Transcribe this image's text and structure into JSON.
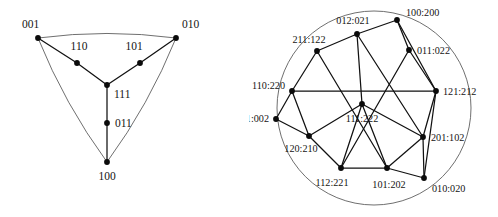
{
  "figure": {
    "title": "",
    "panels": [
      {
        "id": "left",
        "name": "binary-triangle-graph",
        "shape": "curved-triangle",
        "boundary_color": "#555555",
        "edge_color": "#111111",
        "vertex_color": "#0b0b0b",
        "nodes": [
          {
            "id": "n001",
            "label": "001",
            "x": 38,
            "y": 38,
            "lx": 22,
            "ly": 28,
            "anchor": "start"
          },
          {
            "id": "n010",
            "label": "010",
            "x": 176,
            "y": 38,
            "lx": 182,
            "ly": 28,
            "anchor": "start"
          },
          {
            "id": "n110",
            "label": "110",
            "x": 77,
            "y": 63,
            "lx": 79,
            "ly": 50,
            "anchor": "middle"
          },
          {
            "id": "n101",
            "label": "101",
            "x": 140,
            "y": 63,
            "lx": 134,
            "ly": 50,
            "anchor": "middle"
          },
          {
            "id": "n111",
            "label": "111",
            "x": 107,
            "y": 85,
            "lx": 114,
            "ly": 98,
            "anchor": "start"
          },
          {
            "id": "n011",
            "label": "011",
            "x": 107,
            "y": 123,
            "lx": 115,
            "ly": 127,
            "anchor": "start"
          },
          {
            "id": "n100",
            "label": "100",
            "x": 107,
            "y": 162,
            "lx": 107,
            "ly": 180,
            "anchor": "middle"
          }
        ],
        "edges": [
          [
            "n001",
            "n110"
          ],
          [
            "n110",
            "n111"
          ],
          [
            "n010",
            "n101"
          ],
          [
            "n101",
            "n111"
          ],
          [
            "n111",
            "n011"
          ],
          [
            "n011",
            "n100"
          ]
        ]
      },
      {
        "id": "right",
        "name": "ternary-wheel-graph",
        "shape": "circle",
        "boundary_color": "#555555",
        "edge_color": "#111111",
        "vertex_color": "#0b0b0b",
        "circle": {
          "cx": 125,
          "cy": 108,
          "r": 97
        },
        "nodes": [
          {
            "id": "r100",
            "label": "100:200",
            "x": 148,
            "y": 20,
            "lx": 157,
            "ly": 16,
            "anchor": "start"
          },
          {
            "id": "r012",
            "label": "012:021",
            "x": 108,
            "y": 34,
            "lx": 104,
            "ly": 24,
            "anchor": "middle"
          },
          {
            "id": "r211",
            "label": "211:122",
            "x": 68,
            "y": 51,
            "lx": 60,
            "ly": 43,
            "anchor": "middle"
          },
          {
            "id": "r011",
            "label": "011:022",
            "x": 160,
            "y": 50,
            "lx": 168,
            "ly": 54,
            "anchor": "start"
          },
          {
            "id": "r110",
            "label": "110:220",
            "x": 43,
            "y": 91,
            "lx": 36,
            "ly": 89,
            "anchor": "end"
          },
          {
            "id": "r121",
            "label": "121:212",
            "x": 187,
            "y": 91,
            "lx": 194,
            "ly": 95,
            "anchor": "start"
          },
          {
            "id": "r001",
            "label": "001:002",
            "x": 27,
            "y": 119,
            "lx": 20,
            "ly": 122,
            "anchor": "end"
          },
          {
            "id": "r111",
            "label": "111:222",
            "x": 113,
            "y": 104,
            "lx": 113,
            "ly": 122,
            "anchor": "middle"
          },
          {
            "id": "r120",
            "label": "120:210",
            "x": 60,
            "y": 136,
            "lx": 52,
            "ly": 152,
            "anchor": "middle"
          },
          {
            "id": "r201",
            "label": "201:102",
            "x": 174,
            "y": 137,
            "lx": 182,
            "ly": 141,
            "anchor": "start"
          },
          {
            "id": "r112",
            "label": "112:221",
            "x": 92,
            "y": 168,
            "lx": 83,
            "ly": 186,
            "anchor": "middle"
          },
          {
            "id": "r101",
            "label": "101:202",
            "x": 138,
            "y": 168,
            "lx": 140,
            "ly": 188,
            "anchor": "middle"
          },
          {
            "id": "r010",
            "label": "010:020",
            "x": 175,
            "y": 178,
            "lx": 183,
            "ly": 192,
            "anchor": "start"
          }
        ],
        "edges": [
          [
            "r100",
            "r012"
          ],
          [
            "r100",
            "r011"
          ],
          [
            "r100",
            "r121"
          ],
          [
            "r012",
            "r211"
          ],
          [
            "r012",
            "r111"
          ],
          [
            "r012",
            "r201"
          ],
          [
            "r211",
            "r110"
          ],
          [
            "r211",
            "r101"
          ],
          [
            "r011",
            "r121"
          ],
          [
            "r011",
            "r112"
          ],
          [
            "r110",
            "r121"
          ],
          [
            "r110",
            "r120"
          ],
          [
            "r110",
            "r001"
          ],
          [
            "r121",
            "r201"
          ],
          [
            "r001",
            "r120"
          ],
          [
            "r111",
            "r120"
          ],
          [
            "r111",
            "r112"
          ],
          [
            "r111",
            "r101"
          ],
          [
            "r111",
            "r201"
          ],
          [
            "r120",
            "r112"
          ],
          [
            "r201",
            "r101"
          ],
          [
            "r201",
            "r010"
          ],
          [
            "r112",
            "r101"
          ],
          [
            "r101",
            "r010"
          ],
          [
            "r010",
            "r121"
          ]
        ]
      }
    ]
  }
}
